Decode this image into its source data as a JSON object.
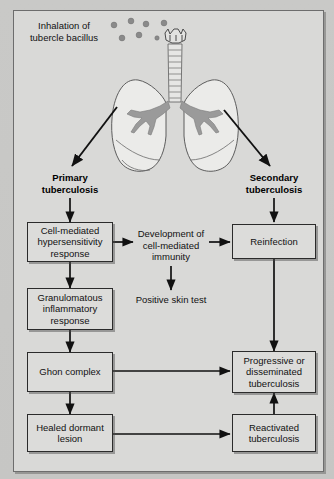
{
  "figure": {
    "caption": "Inhalation of tubercle bacillus",
    "bacillus_dot_count": 7,
    "dot_color": "#8a8a8a",
    "anatomy": {
      "larynx": "larynx",
      "trachea": "trachea",
      "left_lung": "left-lung",
      "right_lung": "right-lung",
      "bronchial_tree": "bronchial-tree"
    }
  },
  "branches": {
    "primary": "Primary\ntuberculosis",
    "primary_line1": "Primary",
    "primary_line2": "tuberculosis",
    "secondary_line1": "Secondary",
    "secondary_line2": "tuberculosis"
  },
  "nodes": {
    "cell_mediated_hypersensitivity": "Cell-mediated hypersensitivity response",
    "granulomatous": "Granulomatous inflammatory response",
    "ghon_complex": "Ghon complex",
    "healed_dormant_lesion": "Healed dormant lesion",
    "reinfection": "Reinfection",
    "progressive": "Progressive or disseminated tuberculosis",
    "reactivated": "Reactivated tuberculosis"
  },
  "plain_labels": {
    "development_immunity": "Development of cell-mediated immunity",
    "positive_skin_test": "Positive skin test"
  },
  "colors": {
    "page_background": "#c9c9c7",
    "panel_background": "#d9d9d7",
    "box_fill": "#dcdcda",
    "box_border": "#2b2b2b",
    "arrow": "#111111",
    "lung_fill": "#e8e8e6",
    "bronchi_fill": "#9a9a9a"
  }
}
